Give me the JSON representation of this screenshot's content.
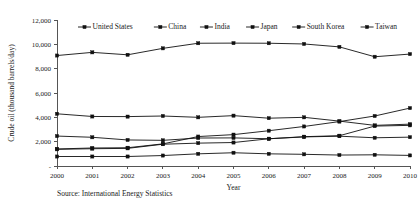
{
  "figure": {
    "source_note": "Source: International Energy Statistics"
  },
  "chart_data": {
    "type": "line",
    "title": "",
    "xlabel": "Year",
    "ylabel": "Crude oil (thousand barrels/day)",
    "categories": [
      "2000",
      "2001",
      "2002",
      "2003",
      "2004",
      "2005",
      "2006",
      "2007",
      "2008",
      "2009",
      "2010"
    ],
    "x": [
      2000,
      2001,
      2002,
      2003,
      2004,
      2005,
      2006,
      2007,
      2008,
      2009,
      2010
    ],
    "xlim": [
      2000,
      2010
    ],
    "ylim": [
      0,
      12000
    ],
    "ytick_labels": [
      "-",
      "2,000",
      "4,000",
      "6,000",
      "8,000",
      "10,000",
      "12,000"
    ],
    "ytick_values": [
      0,
      2000,
      4000,
      6000,
      8000,
      10000,
      12000
    ],
    "grid": false,
    "legend_position": "top-center",
    "marker": "square",
    "series": [
      {
        "name": "United States",
        "marker": "square",
        "values": [
          9080,
          9340,
          9140,
          9670,
          10090,
          10100,
          10090,
          10030,
          9790,
          8980,
          9200
        ]
      },
      {
        "name": "China",
        "marker": "square",
        "values": [
          1400,
          1480,
          1500,
          1820,
          2420,
          2580,
          2900,
          3250,
          3650,
          4110,
          4760
        ]
      },
      {
        "name": "India",
        "marker": "square",
        "values": [
          1370,
          1420,
          1450,
          1790,
          1880,
          1930,
          2240,
          2410,
          2490,
          3280,
          3340
        ]
      },
      {
        "name": "Japan",
        "marker": "square",
        "values": [
          4290,
          4070,
          4060,
          4110,
          4000,
          4140,
          3930,
          4000,
          3690,
          3340,
          3440
        ]
      },
      {
        "name": "South Korea",
        "marker": "square",
        "values": [
          2460,
          2360,
          2140,
          2110,
          2300,
          2310,
          2240,
          2390,
          2450,
          2320,
          2370
        ]
      },
      {
        "name": "Taiwan",
        "marker": "square",
        "values": [
          780,
          780,
          780,
          860,
          1000,
          1090,
          1000,
          960,
          900,
          920,
          870
        ]
      }
    ],
    "colors": {
      "series_stroke": "#111111",
      "axis": "#555555",
      "background": "#ffffff"
    }
  }
}
